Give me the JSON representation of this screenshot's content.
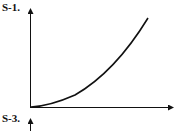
{
  "panels": [
    {
      "label": "S-1.",
      "curve": "convex increasing from origin",
      "axes": {
        "x_arrow": true,
        "y_arrow": true
      }
    },
    {
      "label": "S-3.",
      "axes": {
        "y_arrow": true
      }
    }
  ],
  "colors": {
    "stroke": "#111111",
    "background": "#ffffff"
  }
}
